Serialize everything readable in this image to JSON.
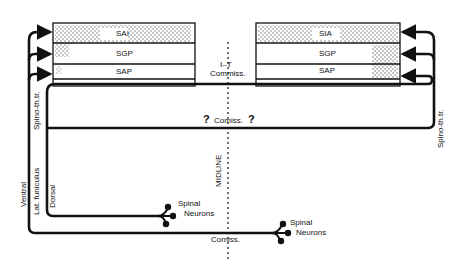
{
  "diagram": {
    "left_box": {
      "layers": [
        {
          "label": "SAI"
        },
        {
          "label": "SGP"
        },
        {
          "label": "SAP"
        }
      ]
    },
    "right_box": {
      "layers": [
        {
          "label": "SIA"
        },
        {
          "label": "SGP"
        },
        {
          "label": "SAP"
        }
      ]
    },
    "labels": {
      "it_commiss_line1": "I–T",
      "it_commiss_line2": "Commiss.",
      "comiss_middle": "Comiss.",
      "question_left": "?",
      "question_right": "?",
      "comiss_bottom": "Comiss.",
      "midline": "MIDLINE",
      "spino_th_left": "Spino-th.tr.",
      "spino_th_right": "Spino-th.tr.",
      "ventral": "Ventral",
      "lat_funiculus": "Lat. funiculus",
      "dorsal": "Dorsal",
      "spinal_neurons_1_line1": "Spinal",
      "spinal_neurons_1_line2": "Neurons",
      "spinal_neurons_2_line1": "Spinal",
      "spinal_neurons_2_line2": "Neurons"
    },
    "colors": {
      "line": "#111111",
      "stipple": "#9a9a9a",
      "background": "#ffffff"
    }
  }
}
